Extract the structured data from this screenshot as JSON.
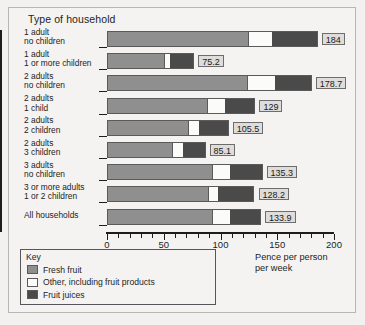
{
  "chart_data": {
    "type": "bar",
    "orientation": "horizontal",
    "stacked": true,
    "title": "Type of household",
    "xlabel": "Pence per person per week",
    "ylabel": "Type of household",
    "xlim": [
      0,
      200
    ],
    "xticks": [
      0,
      50,
      100,
      150,
      200
    ],
    "xtick_labels": [
      "0",
      "50",
      "100",
      "150",
      "200"
    ],
    "minor_tick_step": 10,
    "grid": false,
    "legend_position": "bottom-left",
    "categories": [
      "1 adult no children",
      "1 adult 1 or more children",
      "2 adults no children",
      "2 adults 1 child",
      "2 adults 2 children",
      "2 adults 3 children",
      "3 adults no children",
      "3 or more adults 1 or 2 children",
      "All households"
    ],
    "category_lines": [
      [
        "1 adult",
        "no children"
      ],
      [
        "1 adult",
        "1 or more children"
      ],
      [
        "2 adults",
        "no children"
      ],
      [
        "2 adults",
        "1 child"
      ],
      [
        "2 adults",
        "2 children"
      ],
      [
        "2 adults",
        "3 children"
      ],
      [
        "3 adults",
        "no children"
      ],
      [
        "3 or more adults",
        "1 or 2 children"
      ],
      [
        "All households"
      ]
    ],
    "series": [
      {
        "name": "Fresh fruit",
        "color": "#8f8f8f",
        "values": [
          124.0,
          50.5,
          123.0,
          88.0,
          71.0,
          57.0,
          92.5,
          89.0,
          92.5
        ]
      },
      {
        "name": "Other, including fruit products",
        "color": "#fbfbfa",
        "values": [
          20.5,
          4.5,
          24.0,
          15.0,
          9.5,
          9.0,
          15.0,
          8.0,
          15.0
        ]
      },
      {
        "name": "Fruit juices",
        "color": "#4a4a4a",
        "values": [
          39.5,
          20.2,
          31.7,
          26.0,
          25.0,
          19.1,
          27.8,
          31.2,
          26.4
        ]
      }
    ],
    "totals": [
      184,
      75.2,
      178.7,
      129,
      105.5,
      85.1,
      135.3,
      128.2,
      133.9
    ],
    "total_labels": [
      "184",
      "75.2",
      "178.7",
      "129",
      "105.5",
      "85.1",
      "135.3",
      "128.2",
      "133.9"
    ]
  },
  "legend": {
    "title": "Key",
    "entries": [
      {
        "label": "Fresh fruit",
        "color": "#8f8f8f"
      },
      {
        "label": "Other, including fruit products",
        "color": "#fbfbfa"
      },
      {
        "label": "Fruit juices",
        "color": "#4a4a4a"
      }
    ]
  },
  "axis_caption": {
    "line1": "Pence per person",
    "line2": "per week"
  }
}
